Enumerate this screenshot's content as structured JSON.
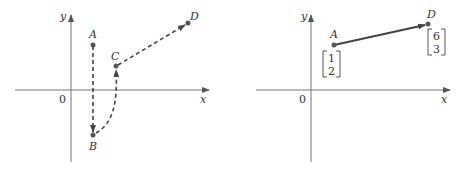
{
  "colors": {
    "axis": "#555555",
    "path": "#444444",
    "point": "#555555",
    "text": "#333333"
  },
  "left_panel": {
    "axes": {
      "x_label": "x",
      "y_label": "y",
      "origin_label": "0"
    },
    "points": [
      {
        "name": "A",
        "label": "A"
      },
      {
        "name": "B",
        "label": "B"
      },
      {
        "name": "C",
        "label": "C"
      },
      {
        "name": "D",
        "label": "D"
      }
    ],
    "path": [
      "A",
      "B",
      "C",
      "D"
    ],
    "path_style": "dashed"
  },
  "right_panel": {
    "axes": {
      "x_label": "x",
      "y_label": "y",
      "origin_label": "0"
    },
    "points": [
      {
        "name": "A",
        "label": "A",
        "vector": [
          "1",
          "2"
        ]
      },
      {
        "name": "D",
        "label": "D",
        "vector": [
          "6",
          "3"
        ]
      }
    ],
    "arrow": {
      "from": "A",
      "to": "D",
      "style": "solid"
    }
  }
}
